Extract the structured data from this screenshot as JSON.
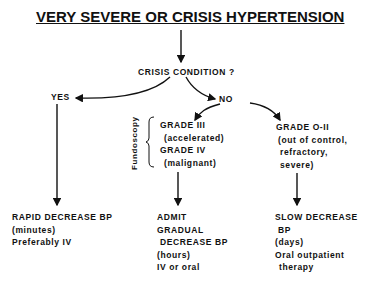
{
  "title": "VERY SEVERE OR CRISIS HYPERTENSION",
  "question": "CRISIS  CONDITION ?",
  "yes_label": "YES",
  "no_label": "NO",
  "fundoscopy_label": "Fundoscopy",
  "grade_high": {
    "line1": "GRADE  III",
    "line2": "(accelerated)",
    "line3": "GRADE  IV",
    "line4": "(malignant)"
  },
  "grade_low": {
    "line1": "GRADE  O-II",
    "line2": "(out of control,",
    "line3": "refractory,",
    "line4": "severe)"
  },
  "outcome_yes": {
    "line1": "RAPID DECREASE BP",
    "line2": "(minutes)",
    "line3": "Preferably  IV"
  },
  "outcome_high": {
    "line1": "ADMIT",
    "line2": "GRADUAL",
    "line3": " DECREASE BP",
    "line4": "(hours)",
    "line5": "IV or oral"
  },
  "outcome_low": {
    "line1": "SLOW DECREASE",
    "line2": " BP",
    "line3": "(days)",
    "line4": "Oral outpatient",
    "line5": "  therapy"
  }
}
